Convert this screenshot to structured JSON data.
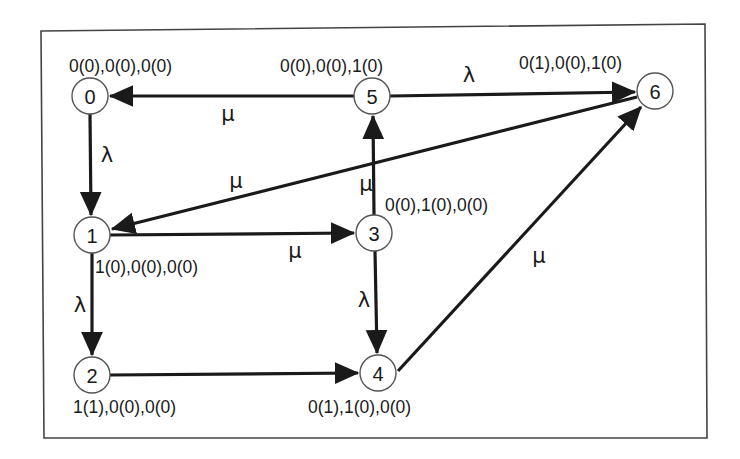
{
  "diagram": {
    "type": "state-transition-diagram",
    "nodes": [
      {
        "id": "0",
        "label": "0",
        "state": "0(0),0(0),0(0)",
        "cx": 90,
        "cy": 96
      },
      {
        "id": "1",
        "label": "1",
        "state": "1(0),0(0),0(0)",
        "cx": 92,
        "cy": 235
      },
      {
        "id": "2",
        "label": "2",
        "state": "1(1),0(0),0(0)",
        "cx": 92,
        "cy": 375
      },
      {
        "id": "3",
        "label": "3",
        "state": "0(0),1(0),0(0)",
        "cx": 374,
        "cy": 233
      },
      {
        "id": "4",
        "label": "4",
        "state": "0(1),1(0),0(0)",
        "cx": 378,
        "cy": 373
      },
      {
        "id": "5",
        "label": "5",
        "state": "0(0),0(0),1(0)",
        "cx": 372,
        "cy": 96
      },
      {
        "id": "6",
        "label": "6",
        "state": "0(1),0(0),1(0)",
        "cx": 655,
        "cy": 91
      }
    ],
    "edges": [
      {
        "from": "0",
        "to": "1",
        "rate": "λ"
      },
      {
        "from": "1",
        "to": "2",
        "rate": "λ"
      },
      {
        "from": "1",
        "to": "3",
        "rate": "μ"
      },
      {
        "from": "2",
        "to": "4",
        "rate": ""
      },
      {
        "from": "3",
        "to": "4",
        "rate": "λ"
      },
      {
        "from": "3",
        "to": "5",
        "rate": "μ"
      },
      {
        "from": "4",
        "to": "6",
        "rate": "μ"
      },
      {
        "from": "5",
        "to": "0",
        "rate": "μ"
      },
      {
        "from": "5",
        "to": "6",
        "rate": "λ"
      },
      {
        "from": "6",
        "to": "1",
        "rate": "μ"
      }
    ],
    "colors": {
      "edge": "#1a1a1a",
      "node_border": "#555555",
      "frame": "#444444",
      "background": "#ffffff"
    }
  }
}
